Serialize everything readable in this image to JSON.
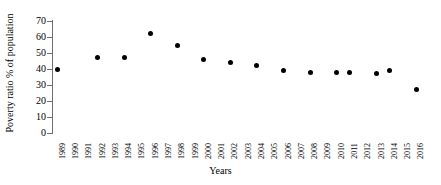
{
  "chart_data": {
    "type": "scatter",
    "title": "",
    "xlabel": "Years",
    "ylabel": "Poverty ratio % of population",
    "ylim": [
      0,
      70
    ],
    "yticks": [
      0,
      10,
      20,
      30,
      40,
      50,
      60,
      70
    ],
    "grid": false,
    "legend": null,
    "marker": "filled-circle",
    "marker_color": "#000000",
    "categories": [
      "1989",
      "1990",
      "1991",
      "1992",
      "1993",
      "1994",
      "1995",
      "1996",
      "1997",
      "1998",
      "1999",
      "2000",
      "2001",
      "2002",
      "2003",
      "2004",
      "2005",
      "2006",
      "2007",
      "2008",
      "2009",
      "2010",
      "2011",
      "2012",
      "2013",
      "2014",
      "2015",
      "2016"
    ],
    "points": [
      {
        "x": "1989",
        "y": 40
      },
      {
        "x": "1992",
        "y": 47
      },
      {
        "x": "1994",
        "y": 47
      },
      {
        "x": "1996",
        "y": 62
      },
      {
        "x": "1998",
        "y": 55
      },
      {
        "x": "2000",
        "y": 46
      },
      {
        "x": "2002",
        "y": 44
      },
      {
        "x": "2004",
        "y": 42
      },
      {
        "x": "2006",
        "y": 39
      },
      {
        "x": "2008",
        "y": 38
      },
      {
        "x": "2010",
        "y": 38
      },
      {
        "x": "2011",
        "y": 38
      },
      {
        "x": "2013",
        "y": 37
      },
      {
        "x": "2014",
        "y": 39
      },
      {
        "x": "2016",
        "y": 27
      }
    ]
  }
}
